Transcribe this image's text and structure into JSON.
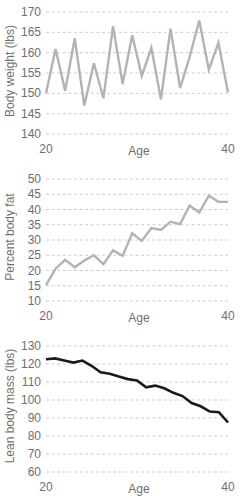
{
  "figure": {
    "title": "",
    "background": "#ffffff",
    "panel_count": 3
  },
  "chart_data": [
    {
      "type": "line",
      "title": "",
      "xlabel": "Age",
      "ylabel": "Body weight (lbs)",
      "xlim": [
        20,
        40
      ],
      "ylim": [
        140,
        170
      ],
      "xticks": [
        20,
        40
      ],
      "xticklabels": [
        "20",
        "40"
      ],
      "yticks": [
        140,
        145,
        150,
        155,
        160,
        165,
        170
      ],
      "yticklabels": [
        "140",
        "145",
        "150",
        "155",
        "160",
        "165",
        "170"
      ],
      "grid": "horizontal-dashed",
      "legend": "none",
      "line_color": "#b3b3b3",
      "line_width": 2.4,
      "x": [
        21,
        22,
        23,
        24,
        25,
        26,
        27,
        28,
        29,
        30,
        31,
        32,
        33,
        34,
        35,
        36,
        37,
        38,
        39,
        40
      ],
      "values": [
        150.0,
        160.9,
        150.6,
        163.5,
        147.0,
        157.4,
        148.8,
        166.5,
        152.3,
        164.3,
        154.3,
        161.2,
        148.5,
        165.9,
        151.3,
        159.0,
        167.9,
        155.8,
        162.4,
        150.2
      ]
    },
    {
      "type": "line",
      "title": "",
      "xlabel": "Age",
      "ylabel": "Percent body fat",
      "xlim": [
        20,
        40
      ],
      "ylim": [
        10,
        50
      ],
      "xticks": [
        20,
        40
      ],
      "xticklabels": [
        "20",
        "40"
      ],
      "yticks": [
        10,
        15,
        20,
        25,
        30,
        35,
        40,
        45,
        50
      ],
      "yticklabels": [
        "10",
        "15",
        "20",
        "25",
        "30",
        "35",
        "40",
        "45",
        "50"
      ],
      "grid": "horizontal-dashed",
      "legend": "none",
      "line_color": "#b3b3b3",
      "line_width": 2.4,
      "x": [
        21,
        22,
        23,
        24,
        25,
        26,
        27,
        28,
        29,
        30,
        31,
        32,
        33,
        34,
        35,
        36,
        37,
        38,
        39,
        40
      ],
      "values": [
        15.2,
        20.6,
        23.5,
        21.1,
        23.3,
        25.0,
        22.1,
        26.6,
        24.8,
        32.2,
        29.7,
        33.9,
        33.3,
        36.0,
        35.2,
        41.3,
        39.0,
        44.5,
        42.5,
        42.5
      ]
    },
    {
      "type": "line",
      "title": "",
      "xlabel": "Age",
      "ylabel": "Lean body mass (lbs)",
      "xlim": [
        20,
        40
      ],
      "ylim": [
        60,
        130
      ],
      "xticks": [
        20,
        40
      ],
      "xticklabels": [
        "20",
        "40"
      ],
      "yticks": [
        60,
        70,
        80,
        90,
        100,
        110,
        120,
        130
      ],
      "yticklabels": [
        "60",
        "70",
        "80",
        "90",
        "100",
        "110",
        "120",
        "130"
      ],
      "grid": "horizontal-dashed",
      "legend": "none",
      "line_color": "#1a1a1a",
      "line_width": 2.6,
      "x": [
        21,
        22,
        23,
        24,
        25,
        26,
        27,
        28,
        29,
        30,
        31,
        32,
        33,
        34,
        35,
        36,
        37,
        38,
        39,
        40
      ],
      "values": [
        122.6,
        123.1,
        121.9,
        120.8,
        121.9,
        119.0,
        115.4,
        114.6,
        113.0,
        111.6,
        110.9,
        107.0,
        108.0,
        106.5,
        104.0,
        102.2,
        98.3,
        96.5,
        93.6,
        93.2,
        87.5
      ]
    }
  ]
}
